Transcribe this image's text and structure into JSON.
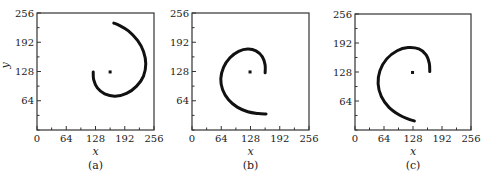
{
  "chart_data": [
    {
      "type": "scatter",
      "panel_label": "(a)",
      "xlabel": "x",
      "ylabel": "y",
      "xlim": [
        0,
        256
      ],
      "ylim": [
        0,
        256
      ],
      "xticks": [
        0,
        64,
        128,
        192,
        256
      ],
      "yticks": [
        64,
        128,
        192,
        256
      ],
      "grid": false,
      "center_point": [
        160,
        127
      ],
      "spiral": {
        "description": "spiral arc from inner end near center to outer end at top",
        "points": [
          [
            123,
            127
          ],
          [
            124,
            110
          ],
          [
            132,
            92
          ],
          [
            148,
            79
          ],
          [
            171,
            74
          ],
          [
            196,
            80
          ],
          [
            218,
            96
          ],
          [
            233,
            118
          ],
          [
            238,
            145
          ],
          [
            233,
            172
          ],
          [
            220,
            196
          ],
          [
            200,
            217
          ],
          [
            180,
            229
          ],
          [
            168,
            234
          ]
        ]
      }
    },
    {
      "type": "scatter",
      "panel_label": "(b)",
      "xlabel": "x",
      "ylabel": "",
      "xlim": [
        0,
        256
      ],
      "ylim": [
        0,
        256
      ],
      "xticks": [
        0,
        64,
        128,
        192,
        256
      ],
      "yticks": [
        64,
        128,
        192,
        256
      ],
      "grid": false,
      "center_point": [
        127,
        127
      ],
      "spiral": {
        "description": "spiral arc from inner end right of center, over the top, around the left to outer end at bottom right",
        "points": [
          [
            160,
            125
          ],
          [
            160,
            142
          ],
          [
            154,
            160
          ],
          [
            140,
            173
          ],
          [
            122,
            177
          ],
          [
            102,
            172
          ],
          [
            83,
            158
          ],
          [
            69,
            137
          ],
          [
            63,
            112
          ],
          [
            67,
            88
          ],
          [
            80,
            66
          ],
          [
            99,
            50
          ],
          [
            122,
            40
          ],
          [
            145,
            36
          ],
          [
            162,
            35
          ]
        ]
      }
    },
    {
      "type": "scatter",
      "panel_label": "(c)",
      "xlabel": "x",
      "ylabel": "",
      "xlim": [
        0,
        256
      ],
      "ylim": [
        0,
        256
      ],
      "xticks": [
        0,
        64,
        128,
        192,
        256
      ],
      "yticks": [
        64,
        128,
        192,
        256
      ],
      "grid": false,
      "center_point": [
        127,
        127
      ],
      "spiral": {
        "description": "spiral arc from inner end right of center, over the top, around the left to outer end at bottom",
        "points": [
          [
            165,
            129
          ],
          [
            164,
            147
          ],
          [
            157,
            166
          ],
          [
            141,
            179
          ],
          [
            117,
            182
          ],
          [
            93,
            175
          ],
          [
            70,
            157
          ],
          [
            55,
            131
          ],
          [
            51,
            102
          ],
          [
            58,
            74
          ],
          [
            75,
            50
          ],
          [
            98,
            33
          ],
          [
            118,
            24
          ],
          [
            131,
            20
          ]
        ]
      }
    }
  ]
}
